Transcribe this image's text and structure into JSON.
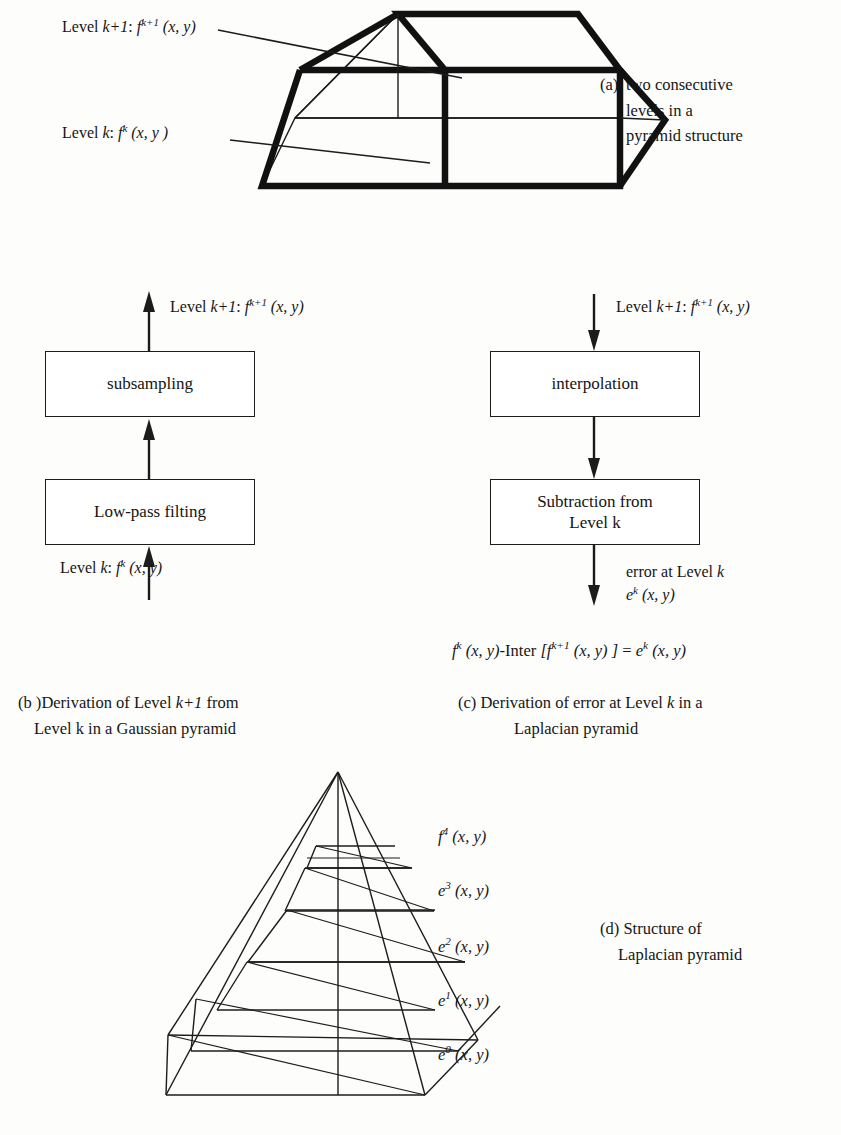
{
  "figure": {
    "panel_a": {
      "label_level_k1": {
        "prefix": "Level ",
        "var": "k+1",
        "colon": ": ",
        "fn": "f",
        "sup": "k+1",
        "args": " (x, y)"
      },
      "label_level_k": {
        "prefix": "Level ",
        "var": "k",
        "colon": ": ",
        "fn": "f",
        "sup": "k",
        "args": " (x, y )"
      },
      "caption_tag": "(a)",
      "caption_line1": "two consecutive",
      "caption_line2": "levels in a",
      "caption_line3": "pyramid structure"
    },
    "panel_b": {
      "top_label": {
        "prefix": "Level ",
        "var": "k+1",
        "colon": ":  ",
        "fn": "f",
        "sup": "k+1",
        "args": " (x, y)"
      },
      "bottom_label": {
        "prefix": "Level ",
        "var": "k",
        "colon": ": ",
        "fn": "f",
        "sup": "k",
        "args": " (x, y)"
      },
      "box_upper": "subsampling",
      "box_lower": "Low-pass filting",
      "caption_tag": "(b )",
      "caption_line1": "Derivation of Level ",
      "caption_line1_italic": "k+1",
      "caption_line1_end": " from",
      "caption_line2": "Level k in a Gaussian pyramid"
    },
    "panel_c": {
      "top_label": {
        "prefix": "Level ",
        "var": "k+1",
        "colon": ":  ",
        "fn": "f",
        "sup": "k+1",
        "args": " (x, y)"
      },
      "box_upper": "interpolation",
      "box_lower_line1": "Subtraction from",
      "box_lower_line2": "Level k",
      "error_line1_a": "error at Level ",
      "error_line1_b": "k",
      "error_line2": {
        "fn": "e",
        "sup": "k",
        "args": " (x, y)"
      },
      "equation": {
        "t1_fn": "f",
        "t1_sup": "k",
        "t1_args": " (x, y)",
        "t2": "-Inter ",
        "t3_open": "[",
        "t3_fn": "f",
        "t3_sup": "k+1",
        "t3_args": " (x, y) ",
        "t3_close": "]",
        "t4": " = ",
        "t5_fn": "e",
        "t5_sup": "k",
        "t5_args": " (x, y)"
      },
      "caption_tag": "(c)",
      "caption_line1": "Derivation of  error at Level ",
      "caption_line1_italic": "k",
      "caption_line1_end": " in a",
      "caption_line2": "Laplacian pyramid"
    },
    "panel_d": {
      "levels": [
        {
          "fn": "f",
          "sup": "4",
          "args": " (x, y)"
        },
        {
          "fn": "e",
          "sup": "3",
          "args": " (x, y)"
        },
        {
          "fn": "e",
          "sup": "2",
          "args": " (x, y)"
        },
        {
          "fn": "e",
          "sup": "1",
          "args": " (x, y)"
        },
        {
          "fn": "e",
          "sup": "0",
          "args": " (x, y)"
        }
      ],
      "caption_tag": "(d)",
      "caption_line1": "Structure of",
      "caption_line2": "Laplacian pyramid"
    }
  },
  "colors": {
    "ink": "#1a1a1a",
    "paper": "#fdfdfc",
    "thick_stroke": "#111111",
    "thin_stroke": "#1c1c1c"
  }
}
